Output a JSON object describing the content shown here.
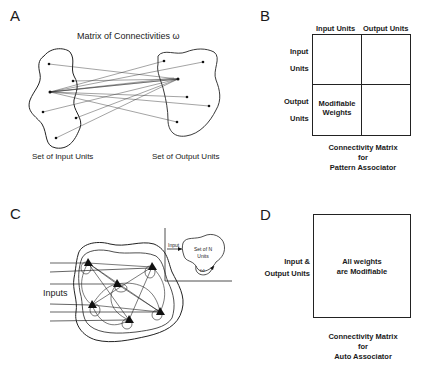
{
  "panels": {
    "a": {
      "letter": "A",
      "title": "Matrix of Connectivities ω",
      "input_label": "Set of Input Units",
      "output_label": "Set of Output Units",
      "input_units": [
        [
          49,
          64
        ],
        [
          73,
          81
        ],
        [
          50,
          92
        ],
        [
          43,
          112
        ],
        [
          76,
          118
        ],
        [
          56,
          138
        ]
      ],
      "output_units": [
        [
          164,
          61
        ],
        [
          203,
          62
        ],
        [
          178,
          79
        ],
        [
          187,
          97
        ],
        [
          209,
          106
        ],
        [
          177,
          122
        ]
      ]
    },
    "b": {
      "letter": "B",
      "col_headers": [
        "Input Units",
        "Output Units"
      ],
      "row_headers": [
        [
          "Input",
          "Units"
        ],
        [
          "Output",
          "Units"
        ]
      ],
      "cell_bottom_left": [
        "Modifiable",
        "Weights"
      ],
      "caption": [
        "Connectivity Matrix",
        "for",
        "Pattern Associator"
      ]
    },
    "c": {
      "letter": "C",
      "inputs_label": "Inputs",
      "inset_input_label": "Input",
      "inset_set_label": [
        "Set of N",
        "Units"
      ],
      "inset_weight_label": "ω",
      "neurons": [
        [
          88,
          263
        ],
        [
          152,
          267
        ],
        [
          117,
          284
        ],
        [
          92,
          305
        ],
        [
          160,
          312
        ],
        [
          129,
          320
        ]
      ]
    },
    "d": {
      "letter": "D",
      "row_header": [
        "Input &",
        "Output Units"
      ],
      "cell_text": [
        "All weights",
        "are Modifiable"
      ],
      "caption": [
        "Connectivity Matrix",
        "for",
        "Auto Associator"
      ]
    }
  }
}
